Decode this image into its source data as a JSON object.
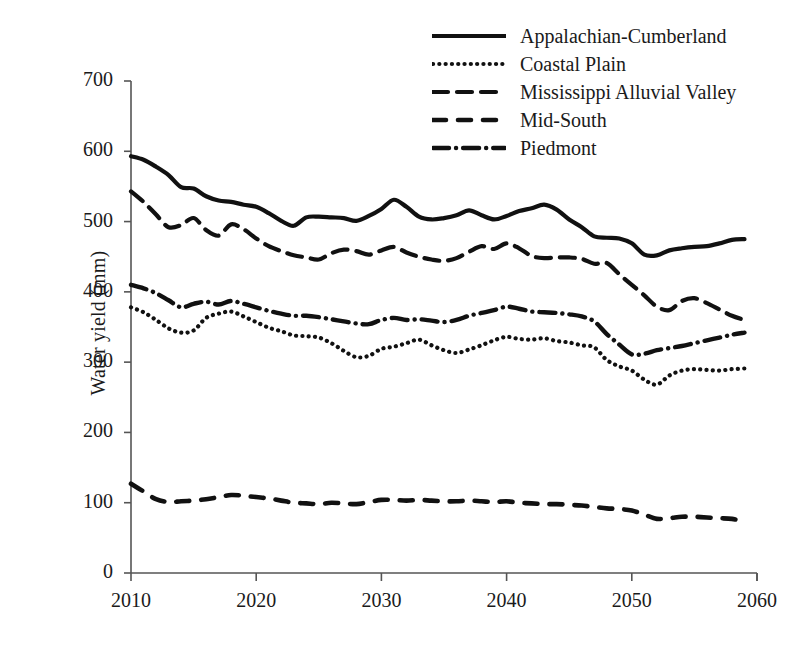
{
  "chart_data": {
    "type": "line",
    "title": "",
    "subtitle": "",
    "xlabel": "",
    "ylabel": "Water yield (mm)",
    "xlim": [
      2010,
      2060
    ],
    "ylim": [
      0,
      700
    ],
    "grid": false,
    "legend_position": "top-right",
    "xticks": [
      "2010",
      "2020",
      "2030",
      "2040",
      "2050",
      "2060"
    ],
    "yticks": [
      "0",
      "100",
      "200",
      "300",
      "400",
      "500",
      "600",
      "700"
    ],
    "x": [
      2010,
      2011,
      2012,
      2013,
      2014,
      2015,
      2016,
      2017,
      2018,
      2019,
      2020,
      2021,
      2022,
      2023,
      2024,
      2025,
      2026,
      2027,
      2028,
      2029,
      2030,
      2031,
      2032,
      2033,
      2034,
      2035,
      2036,
      2037,
      2038,
      2039,
      2040,
      2041,
      2042,
      2043,
      2044,
      2045,
      2046,
      2047,
      2048,
      2049,
      2050,
      2051,
      2052,
      2053,
      2054,
      2055,
      2056,
      2057,
      2058,
      2059
    ],
    "series": [
      {
        "name": "Appalachian-Cumberland",
        "style": "solid",
        "values": [
          593,
          588,
          578,
          566,
          549,
          547,
          536,
          530,
          528,
          524,
          521,
          512,
          501,
          494,
          506,
          507,
          506,
          505,
          501,
          508,
          518,
          531,
          521,
          507,
          503,
          505,
          509,
          516,
          509,
          503,
          508,
          515,
          519,
          524,
          517,
          503,
          492,
          479,
          477,
          476,
          469,
          453,
          452,
          459,
          462,
          464,
          465,
          469,
          474,
          475
        ]
      },
      {
        "name": "Coastal Plain",
        "style": "dotted",
        "values": [
          378,
          371,
          360,
          348,
          342,
          345,
          363,
          369,
          372,
          365,
          357,
          349,
          344,
          338,
          337,
          335,
          327,
          316,
          307,
          309,
          319,
          322,
          327,
          332,
          324,
          317,
          313,
          318,
          324,
          331,
          336,
          333,
          332,
          334,
          330,
          328,
          324,
          321,
          303,
          294,
          288,
          275,
          268,
          281,
          288,
          290,
          289,
          288,
          290,
          291
        ]
      },
      {
        "name": "Mississippi Alluvial Valley",
        "style": "dashed-long",
        "values": [
          543,
          528,
          510,
          492,
          495,
          505,
          488,
          480,
          496,
          489,
          476,
          465,
          458,
          452,
          449,
          446,
          455,
          460,
          458,
          453,
          459,
          464,
          456,
          450,
          446,
          444,
          448,
          457,
          465,
          461,
          469,
          462,
          451,
          448,
          449,
          449,
          447,
          440,
          441,
          425,
          410,
          395,
          379,
          374,
          387,
          391,
          384,
          375,
          366,
          360
        ]
      },
      {
        "name": "Mid-South",
        "style": "dashed-short",
        "values": [
          127,
          116,
          105,
          101,
          102,
          103,
          105,
          108,
          111,
          110,
          108,
          106,
          103,
          100,
          99,
          98,
          100,
          99,
          98,
          101,
          104,
          104,
          103,
          104,
          103,
          102,
          102,
          103,
          102,
          101,
          102,
          100,
          99,
          98,
          98,
          97,
          96,
          94,
          92,
          91,
          89,
          83,
          77,
          78,
          80,
          80,
          79,
          78,
          77,
          73
        ]
      },
      {
        "name": "Piedmont",
        "style": "dash-dot",
        "values": [
          410,
          405,
          398,
          388,
          378,
          383,
          386,
          382,
          387,
          383,
          378,
          373,
          369,
          366,
          366,
          364,
          361,
          358,
          355,
          354,
          360,
          363,
          360,
          361,
          359,
          357,
          360,
          366,
          370,
          374,
          379,
          376,
          372,
          371,
          370,
          368,
          365,
          358,
          340,
          325,
          311,
          312,
          317,
          320,
          323,
          327,
          331,
          335,
          339,
          342
        ]
      }
    ]
  },
  "legend": {
    "items": [
      {
        "label": "Appalachian-Cumberland",
        "style": "solid"
      },
      {
        "label": "Coastal Plain",
        "style": "dotted"
      },
      {
        "label": "Mississippi Alluvial Valley",
        "style": "dashed-long"
      },
      {
        "label": "Mid-South",
        "style": "dashed-short"
      },
      {
        "label": "Piedmont",
        "style": "dash-dot"
      }
    ]
  },
  "axes": {
    "y_title": "Water yield (mm)",
    "y_tick_labels": [
      "700",
      "600",
      "500",
      "400",
      "300",
      "200",
      "100",
      "0"
    ],
    "x_tick_labels": [
      "2010",
      "2020",
      "2030",
      "2040",
      "2050",
      "2060"
    ]
  },
  "colors": {
    "line": "#111111",
    "axis": "#555555",
    "background": "#ffffff"
  }
}
